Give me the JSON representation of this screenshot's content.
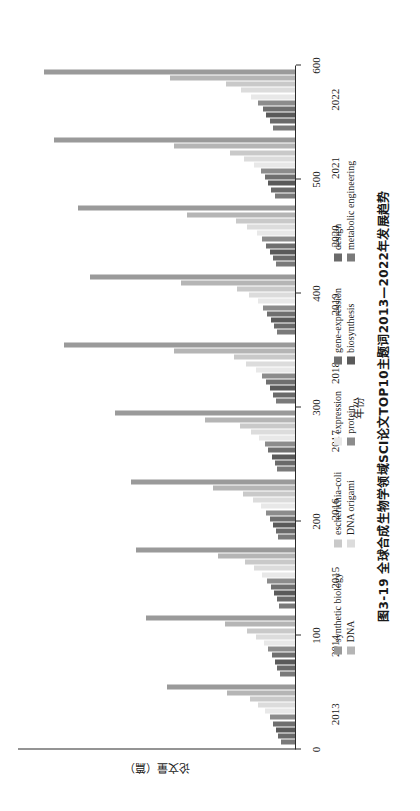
{
  "chart_data": {
    "type": "bar",
    "orientation": "horizontal",
    "title": "",
    "xlabel": "年份",
    "ylabel": "论文量（篇）",
    "ylim": [
      0,
      600
    ],
    "yticks": [
      0,
      100,
      200,
      300,
      400,
      500,
      600
    ],
    "grid": false,
    "legend_position": "bottom",
    "categories": [
      "2013",
      "2014",
      "2015",
      "2016",
      "2017",
      "2018",
      "2019",
      "2020",
      "2021",
      "2022"
    ],
    "series": [
      {
        "name": "synthetic biology",
        "color": "#9a9a9a",
        "values": [
          277,
          322,
          345,
          356,
          390,
          500,
          445,
          469,
          522,
          543
        ]
      },
      {
        "name": "DNA",
        "color": "#b5b5b5",
        "values": [
          148,
          152,
          167,
          177,
          196,
          262,
          247,
          235,
          263,
          271
        ]
      },
      {
        "name": "escherichia-coli",
        "color": "#c9c9c9",
        "values": [
          98,
          103,
          108,
          112,
          120,
          132,
          126,
          128,
          140,
          150
        ]
      },
      {
        "name": "DNA origami",
        "color": "#dcdcdc",
        "values": [
          80,
          85,
          88,
          92,
          96,
          106,
          100,
          104,
          110,
          118
        ]
      },
      {
        "name": "expression",
        "color": "#e8e8e8",
        "values": [
          66,
          68,
          72,
          74,
          78,
          84,
          80,
          83,
          88,
          95
        ]
      },
      {
        "name": "protein",
        "color": "#8c8c8c",
        "values": [
          55,
          58,
          60,
          63,
          66,
          72,
          69,
          71,
          74,
          80
        ]
      },
      {
        "name": "gene-expression",
        "color": "#6f6f6f",
        "values": [
          48,
          50,
          52,
          55,
          58,
          63,
          60,
          62,
          66,
          70
        ]
      },
      {
        "name": "biosynthesis",
        "color": "#5a5a5a",
        "values": [
          42,
          44,
          46,
          48,
          50,
          55,
          53,
          55,
          58,
          62
        ]
      },
      {
        "name": "design",
        "color": "#6a6a6a",
        "values": [
          36,
          38,
          40,
          42,
          44,
          48,
          46,
          48,
          51,
          55
        ]
      },
      {
        "name": "metabolic engineering",
        "color": "#7a7a7a",
        "values": [
          30,
          32,
          34,
          36,
          38,
          41,
          40,
          41,
          44,
          48
        ]
      }
    ]
  },
  "legend": {
    "columns": [
      {
        "items": [
          {
            "label": "synthetic biology"
          },
          {
            "label": "DNA"
          }
        ]
      },
      {
        "items": [
          {
            "label": "escherichia-coli"
          },
          {
            "label": "DNA origami"
          }
        ]
      },
      {
        "items": [
          {
            "label": "expression"
          },
          {
            "label": "protein"
          }
        ]
      },
      {
        "items": [
          {
            "label": "gene-expression"
          },
          {
            "label": "biosynthesis"
          }
        ]
      },
      {
        "items": [
          {
            "label": "design"
          },
          {
            "label": "metabolic engineering"
          }
        ]
      }
    ]
  },
  "caption": {
    "text": "图3-19  全球合成生物学领域SCI论文TOP10主题词2013—2022年发展趋势"
  }
}
